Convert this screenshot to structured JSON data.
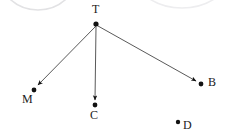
{
  "figure": {
    "type": "vector-diagram",
    "background_color": "#ffffff",
    "stroke_color": "#3b3b3b",
    "dot_color": "#121212",
    "label_color": "#1a1a1a",
    "faint_arc_color": "#e2e2e4",
    "width": 229,
    "height": 139
  },
  "points": [
    {
      "id": "T",
      "label": "T",
      "dot_x": 96,
      "dot_y": 24,
      "dot_r": 2.6,
      "label_x": 92,
      "label_y": 3
    },
    {
      "id": "M",
      "label": "M",
      "dot_x": 34,
      "dot_y": 90,
      "dot_r": 2.4,
      "label_x": 22,
      "label_y": 93
    },
    {
      "id": "C",
      "label": "C",
      "dot_x": 95,
      "dot_y": 105,
      "dot_r": 2.4,
      "label_x": 90,
      "label_y": 109
    },
    {
      "id": "B",
      "label": "B",
      "dot_x": 201,
      "dot_y": 84,
      "dot_r": 2.4,
      "label_x": 208,
      "label_y": 76
    },
    {
      "id": "D",
      "label": "D",
      "dot_x": 178,
      "dot_y": 122,
      "dot_r": 2.2,
      "label_x": 183,
      "label_y": 119
    }
  ],
  "arrows": [
    {
      "id": "T-to-M",
      "from": "T",
      "to": "M",
      "x1": 96,
      "y1": 26,
      "x2": 38,
      "y2": 85
    },
    {
      "id": "T-to-C",
      "from": "T",
      "to": "C",
      "x1": 96,
      "y1": 27,
      "x2": 95,
      "y2": 100
    },
    {
      "id": "T-to-B",
      "from": "T",
      "to": "B",
      "x1": 98,
      "y1": 26,
      "x2": 196,
      "y2": 81
    }
  ],
  "faint_arcs": [
    {
      "id": "arc-top-left",
      "cx": 38,
      "cy": -28,
      "rx": 40,
      "ry": 38
    },
    {
      "id": "arc-top-right",
      "cx": 182,
      "cy": -34,
      "rx": 52,
      "ry": 42
    }
  ]
}
